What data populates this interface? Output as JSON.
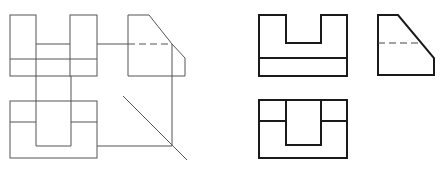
{
  "diagram": {
    "title": "",
    "left_construction": {
      "front_view": {
        "outer_left_block": [
          10,
          15,
          36,
          76
        ],
        "outer_right_block": [
          70,
          15,
          97,
          76
        ],
        "notch_bottom_y": 44,
        "base_line_y": 59,
        "bottom_y": 76
      },
      "side_view": {
        "points": [
          [
            128,
            15
          ],
          [
            149,
            15
          ],
          [
            172,
            44
          ],
          [
            185,
            58
          ],
          [
            185,
            76
          ],
          [
            128,
            76
          ]
        ],
        "hidden_line_y": 44
      },
      "top_view": {
        "rect": [
          10,
          101,
          97,
          158
        ],
        "notch_x": [
          36,
          71
        ],
        "notch_bottom_y": 146,
        "step_y": 122
      },
      "projection_lines": {
        "horizontal_top_y": 44,
        "vertical_x": 172,
        "horizontal_bottom_y": 146,
        "miter_line": [
          [
            123,
            96
          ],
          [
            187,
            160
          ]
        ]
      }
    },
    "right_final": {
      "front_view": {
        "points": [
          [
            259,
            15
          ],
          [
            286,
            15
          ],
          [
            286,
            43
          ],
          [
            321,
            43
          ],
          [
            321,
            15
          ],
          [
            347,
            15
          ],
          [
            347,
            76
          ],
          [
            259,
            76
          ]
        ],
        "base_line_y": 58
      },
      "side_view": {
        "points": [
          [
            378,
            15
          ],
          [
            398,
            15
          ],
          [
            434,
            58
          ],
          [
            434,
            75
          ],
          [
            378,
            75
          ]
        ],
        "hidden_line": [
          [
            378,
            43
          ],
          [
            420,
            43
          ]
        ]
      },
      "top_view": {
        "rect": [
          259,
          100,
          347,
          158
        ],
        "notch_points": [
          [
            286,
            100
          ],
          [
            286,
            145
          ],
          [
            321,
            145
          ],
          [
            321,
            100
          ]
        ],
        "step_lines_y": 121
      }
    }
  }
}
